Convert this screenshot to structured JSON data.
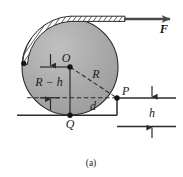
{
  "figure": {
    "caption": "(a)",
    "labels": {
      "center": "O",
      "contact_bottom": "Q",
      "corner_point": "P",
      "radius": "R",
      "force": "F",
      "height_diff": "R − h",
      "horizontal_distance": "d",
      "step_height": "h"
    },
    "icons": {
      "force_arrow": "arrow-right-icon",
      "rope_band": "rope-hatched-band-icon",
      "dimension_arrow_up": "dimension-arrow-up-icon",
      "dimension_arrow_down": "dimension-arrow-down-icon"
    },
    "colors": {
      "disk_fill": "#a9a9a9",
      "disk_edge": "#2b2b2b",
      "line": "#2b2b2b",
      "arrow": "#4a4a4a",
      "background": "#ffffff",
      "text": "#1a1a1a"
    },
    "geometry": {
      "circle_center_x": 70,
      "circle_center_y": 67,
      "circle_radius": 48,
      "point_P_x": 117,
      "point_P_y": 98,
      "point_Q_x": 70,
      "point_Q_y": 115,
      "ground_y": 115,
      "step_top_y": 98
    }
  }
}
